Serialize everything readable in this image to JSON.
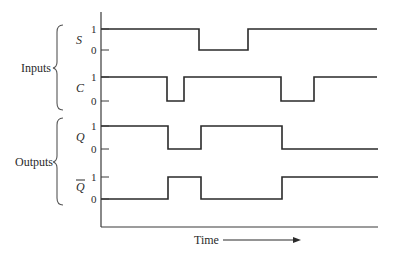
{
  "diagram": {
    "type": "timing-diagram",
    "x_axis_label": "Time",
    "groups": [
      {
        "label": "Inputs",
        "signals": [
          "S",
          "C"
        ]
      },
      {
        "label": "Outputs",
        "signals": [
          "Q",
          "Q̄"
        ]
      }
    ],
    "level_labels": {
      "high": "1",
      "low": "0"
    },
    "signals": [
      {
        "name": "S",
        "overline": false,
        "high_y": 29,
        "low_y": 50,
        "label_y": 44,
        "transitions": [
          [
            101,
            1
          ],
          [
            199,
            0
          ],
          [
            248,
            1
          ],
          [
            377,
            1
          ]
        ]
      },
      {
        "name": "C",
        "overline": false,
        "high_y": 77,
        "low_y": 101,
        "label_y": 92,
        "transitions": [
          [
            101,
            1
          ],
          [
            167,
            0
          ],
          [
            184,
            1
          ],
          [
            281,
            0
          ],
          [
            314,
            1
          ],
          [
            377,
            1
          ]
        ]
      },
      {
        "name": "Q",
        "overline": false,
        "high_y": 126,
        "low_y": 149,
        "label_y": 141,
        "transitions": [
          [
            101,
            1
          ],
          [
            168,
            0
          ],
          [
            201,
            1
          ],
          [
            282,
            0
          ],
          [
            378,
            0
          ]
        ]
      },
      {
        "name": "Q",
        "overline": true,
        "high_y": 177,
        "low_y": 199,
        "label_y": 191,
        "transitions": [
          [
            101,
            0
          ],
          [
            168,
            1
          ],
          [
            201,
            0
          ],
          [
            282,
            1
          ],
          [
            378,
            1
          ]
        ]
      }
    ],
    "axes": {
      "origin_x": 101,
      "top_y": 12,
      "bottom_y": 227,
      "right_x": 378
    },
    "time_arrow": {
      "x1": 223,
      "x2": 300,
      "y": 240
    }
  }
}
